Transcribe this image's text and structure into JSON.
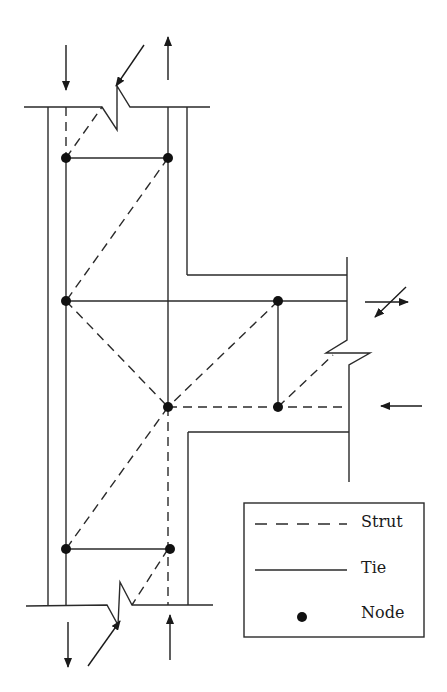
{
  "diagram": {
    "type": "strut-and-tie model",
    "colors": {
      "line": "#2a2a2a",
      "node": "#111111",
      "background": "#ffffff"
    }
  },
  "legend": {
    "items": [
      {
        "label": "Strut",
        "symbol": "dashed-line"
      },
      {
        "label": "Tie",
        "symbol": "solid-line"
      },
      {
        "label": "Node",
        "symbol": "dot"
      }
    ]
  },
  "nodes": [
    {
      "id": "n1",
      "x": 66,
      "y": 158
    },
    {
      "id": "n2",
      "x": 168,
      "y": 158
    },
    {
      "id": "n3",
      "x": 66,
      "y": 301
    },
    {
      "id": "n4",
      "x": 278,
      "y": 301
    },
    {
      "id": "n5",
      "x": 168,
      "y": 407
    },
    {
      "id": "n6",
      "x": 278,
      "y": 407
    },
    {
      "id": "n7",
      "x": 66,
      "y": 549
    },
    {
      "id": "n8",
      "x": 168,
      "y": 549
    }
  ],
  "ties": [
    [
      "n1",
      "n2"
    ],
    [
      "n3",
      "n4"
    ],
    [
      "n4",
      "n6"
    ],
    [
      "n7",
      "n8"
    ],
    [
      "n1",
      "n3"
    ],
    [
      "n3",
      "n7"
    ],
    [
      "n2",
      "n5"
    ],
    [
      "n5",
      "n8"
    ]
  ],
  "struts": [
    [
      "n2",
      "n3"
    ],
    [
      "n3",
      "n5"
    ],
    [
      "n4",
      "n5"
    ],
    [
      "n5",
      "n6"
    ],
    [
      "n5",
      "n7"
    ]
  ],
  "loads": [
    {
      "position": "top-left",
      "direction": "down"
    },
    {
      "position": "top-right",
      "direction": "up"
    },
    {
      "position": "top-diagonal",
      "direction": "down-left"
    },
    {
      "position": "beam-top",
      "direction": "right",
      "with_diagonal": "down-left"
    },
    {
      "position": "beam-bottom",
      "direction": "left"
    },
    {
      "position": "bottom-left",
      "direction": "down"
    },
    {
      "position": "bottom-right",
      "direction": "up"
    },
    {
      "position": "bottom-diagonal",
      "direction": "down-left"
    }
  ]
}
